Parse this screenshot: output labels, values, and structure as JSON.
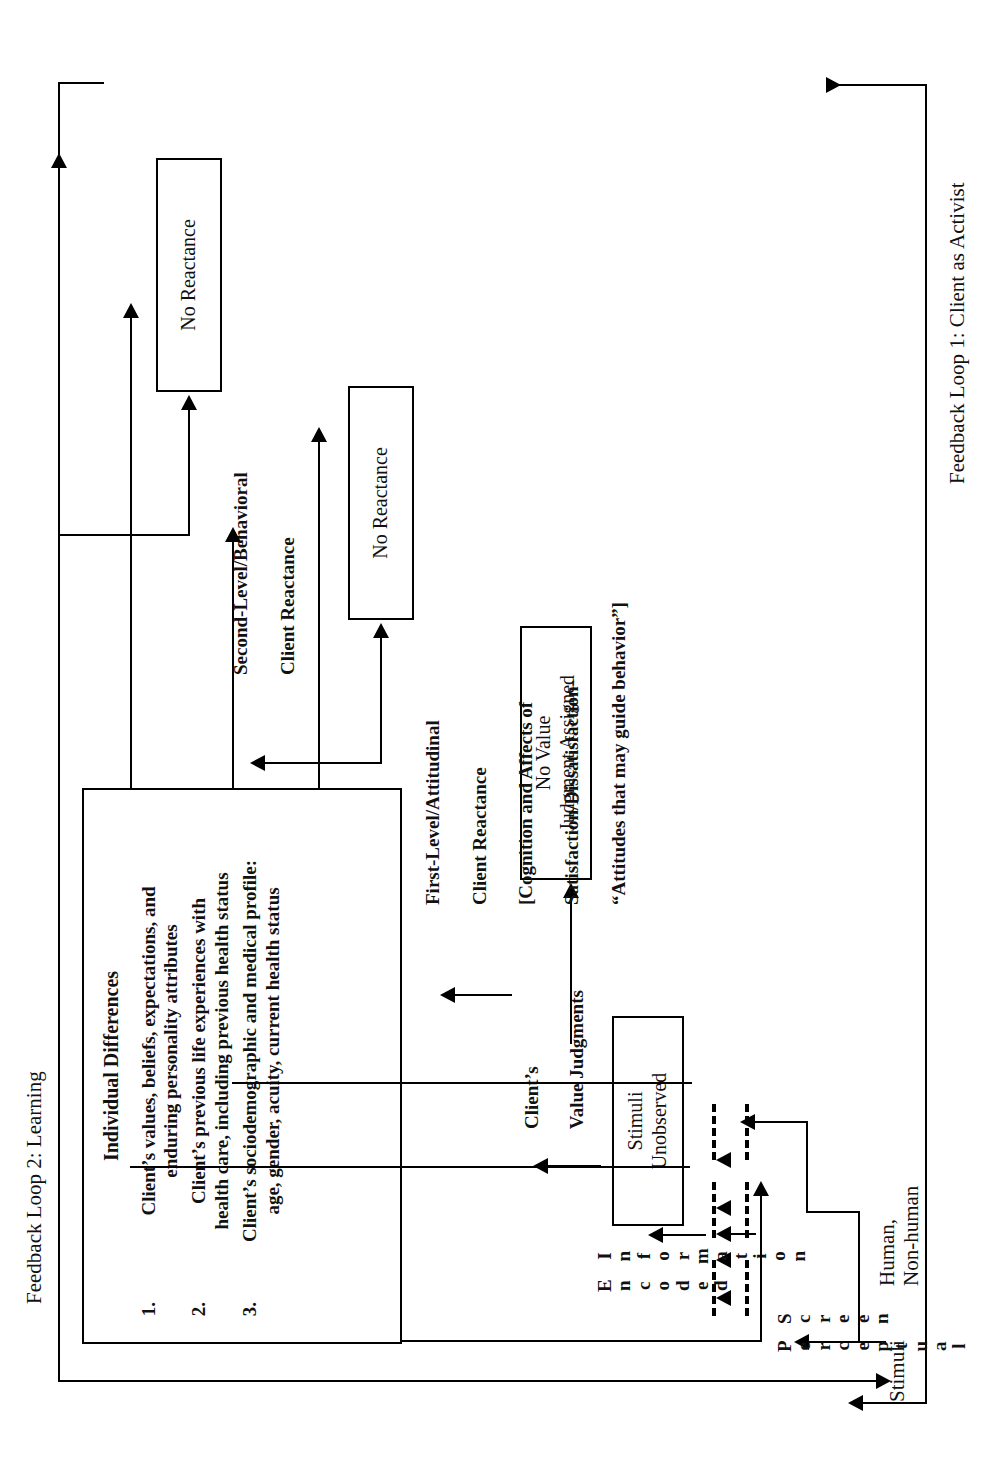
{
  "diagram": {
    "orientation": "rotated-90-ccw",
    "background": "#ffffff",
    "ink": "#000000"
  },
  "feedback_loops": {
    "loop2": "Feedback Loop 2: Learning",
    "loop1": "Feedback Loop 1: Client as Activist"
  },
  "individual_differences": {
    "heading": "Individual Differences",
    "items": [
      {
        "num": "1.",
        "lines": [
          "Client’s values, beliefs, expectations, and",
          "enduring personality attributes"
        ]
      },
      {
        "num": "2.",
        "lines": [
          "Client’s previous life experiences with",
          "health care, including previous health status"
        ]
      },
      {
        "num": "3.",
        "lines": [
          "Client’s sociodemographic and medical profile:",
          "age, gender, acuity, current health status"
        ]
      }
    ]
  },
  "stage_labels": {
    "stimuli": "Stimuli",
    "human_nonhuman": [
      "Human,",
      "Non-",
      "human"
    ],
    "perceptual_screen": "Perceptual Screen",
    "encoded_information": "Encoded Information",
    "client_value_judgments": [
      "Client’s",
      "Value Judgments"
    ],
    "first_level": {
      "line1": "First-Level/Attitudinal",
      "line2": "Client Reactance",
      "line3": "[Cognition and Affects of",
      "line4": "Satisfaction/Dissatisfaction-",
      "line5": "“Attitudes that may guide behavior”]"
    },
    "second_level": {
      "line1": "Second-Level/Behavioral",
      "line2": "Client Reactance"
    }
  },
  "outcome_boxes": [
    {
      "id": "stimuli-unobserved",
      "lines": [
        "Stimuli",
        "Unobserved"
      ]
    },
    {
      "id": "no-value-judgment",
      "lines": [
        "No Value",
        "Judgment Assigned"
      ]
    },
    {
      "id": "no-reactance-1",
      "lines": [
        "No Reactance"
      ]
    },
    {
      "id": "no-reactance-2",
      "lines": [
        "No Reactance"
      ]
    }
  ],
  "stacked_words": {
    "perceptual": [
      "P",
      "e",
      "r",
      "c",
      "e",
      "p",
      "t",
      "u",
      "a",
      "l"
    ],
    "screen": [
      "S",
      "c",
      "r",
      "e",
      "e",
      "n"
    ],
    "encoded": [
      "E",
      "n",
      "c",
      "o",
      "d",
      "e",
      "d"
    ],
    "information": [
      "I",
      "n",
      "f",
      "o",
      "r",
      "m",
      "a",
      "t",
      "i",
      "o",
      "n"
    ]
  }
}
